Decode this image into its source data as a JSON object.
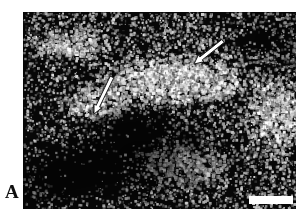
{
  "figure": {
    "domain": "micrograph",
    "modality": "dark-field light micrograph / in situ hybridization autoradiography",
    "panel_label": "A",
    "background_color": "#ffffff",
    "field_color": "#070707",
    "grain_color": "#ffffff",
    "annotation_color": "#ffffff",
    "annotation_outline_color": "#1b1b1b"
  },
  "panel": {
    "label": "A",
    "frame": {
      "x": 23,
      "y": 12,
      "width": 273,
      "height": 197
    }
  },
  "annotations": {
    "arrows": [
      {
        "name": "arrow-upper-right",
        "description": "open white arrow pointing down-left toward bright labelled band",
        "tail_x": 223,
        "tail_y": 41,
        "tip_x": 194,
        "tip_y": 64,
        "length_px": 37,
        "angle_deg": 218
      },
      {
        "name": "arrow-left-center",
        "description": "open white arrow pointing down toward left bright cluster",
        "tail_x": 112,
        "tail_y": 77,
        "tip_x": 94,
        "tip_y": 114,
        "length_px": 41,
        "angle_deg": 244
      }
    ],
    "scale_bar": {
      "name": "scale-bar",
      "x": 249,
      "y": 196,
      "width": 44,
      "height": 8,
      "color": "#ffffff",
      "caption": ""
    }
  },
  "image_content": {
    "description": "Dense field of white silver grains on a black background; a broad bright grain-rich band runs diagonally from the left-centre upward to the upper-right quadrant, with darker grain-poor zones in the lower-left and upper-left corners.",
    "bright_regions": [
      {
        "name": "central-diagonal-band",
        "cx": 0.54,
        "cy": 0.34,
        "rx": 0.3,
        "ry": 0.14,
        "intensity": 1.0
      },
      {
        "name": "left-cluster",
        "cx": 0.26,
        "cy": 0.46,
        "rx": 0.14,
        "ry": 0.1,
        "intensity": 0.85
      },
      {
        "name": "upper-left-band",
        "cx": 0.16,
        "cy": 0.16,
        "rx": 0.16,
        "ry": 0.09,
        "intensity": 0.7
      },
      {
        "name": "right-margin",
        "cx": 0.92,
        "cy": 0.52,
        "rx": 0.12,
        "ry": 0.22,
        "intensity": 0.72
      },
      {
        "name": "lower-center",
        "cx": 0.6,
        "cy": 0.78,
        "rx": 0.18,
        "ry": 0.12,
        "intensity": 0.6
      }
    ],
    "dark_regions": [
      {
        "name": "lower-left-void",
        "cx": 0.22,
        "cy": 0.8,
        "rx": 0.22,
        "ry": 0.18
      },
      {
        "name": "mid-left-void",
        "cx": 0.4,
        "cy": 0.6,
        "rx": 0.16,
        "ry": 0.12
      },
      {
        "name": "upper-right-void",
        "cx": 0.86,
        "cy": 0.12,
        "rx": 0.14,
        "ry": 0.1
      }
    ],
    "grain_count": 5200,
    "grain_size_px": [
      1,
      4
    ]
  }
}
